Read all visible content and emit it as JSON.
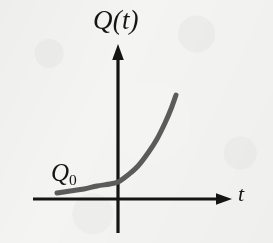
{
  "figure": {
    "name": "exponential-growth-curve",
    "background_color": "#f4f4f2",
    "width": 273,
    "height": 243
  },
  "labels": {
    "y_axis": "Q(t)",
    "x_axis": "t",
    "initial_value_symbol": "Q",
    "initial_value_subscript": "0"
  },
  "colors": {
    "axis": "#141414",
    "curve": "#5b5b5b",
    "text": "#151515"
  },
  "chart_data": {
    "type": "line",
    "title": "",
    "xlabel": "t",
    "ylabel": "Q(t)",
    "grid": false,
    "legend": null,
    "axes": {
      "origin_px": [
        118,
        199
      ],
      "x_axis_px": {
        "start": 33,
        "end": 232,
        "y": 199,
        "arrow": "right"
      },
      "y_axis_px": {
        "top": 45,
        "bottom": 233,
        "x": 118,
        "arrow": "up"
      }
    },
    "series": [
      {
        "name": "Q(t) = Q0 e^(kt)",
        "description": "increasing exponential curve, concave up",
        "stroke_width": 5,
        "points_px": [
          [
            57,
            193
          ],
          [
            70,
            191
          ],
          [
            84,
            189
          ],
          [
            97,
            186
          ],
          [
            110,
            184
          ],
          [
            118,
            182
          ],
          [
            128,
            175
          ],
          [
            138,
            166
          ],
          [
            148,
            153
          ],
          [
            157,
            139
          ],
          [
            165,
            123
          ],
          [
            171,
            109
          ],
          [
            176,
            95
          ]
        ],
        "y_intercept_px": [
          118,
          182
        ],
        "y_intercept_label": "Q0"
      }
    ],
    "annotations": [
      {
        "text": "Q(t)",
        "position_px": [
          93,
          7
        ],
        "role": "y-axis-label"
      },
      {
        "text": "Q0",
        "position_px": [
          51,
          160
        ],
        "role": "initial-value-label"
      },
      {
        "text": "t",
        "position_px": [
          238,
          183
        ],
        "role": "x-axis-label"
      }
    ]
  }
}
